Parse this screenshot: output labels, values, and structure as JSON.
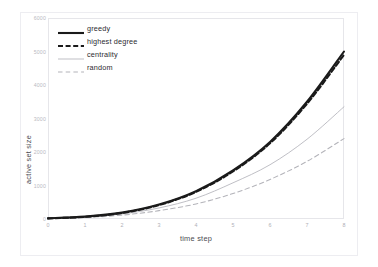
{
  "caption_fragment": "",
  "chart_data": {
    "type": "line",
    "title": "",
    "xlabel": "time step",
    "ylabel": "active set size",
    "xlim": [
      0,
      8
    ],
    "ylim": [
      0,
      6000
    ],
    "xticks": [
      "0",
      "1",
      "2",
      "3",
      "4",
      "5",
      "6",
      "7",
      "8"
    ],
    "yticks": [
      "0",
      "1000",
      "2000",
      "3000",
      "4000",
      "5000",
      "6000"
    ],
    "grid": false,
    "legend_position": "upper-left-inside",
    "x": [
      0,
      1,
      2,
      3,
      4,
      5,
      6,
      7,
      8
    ],
    "series": [
      {
        "name": "greedy",
        "style": "solid",
        "width": 2.1,
        "color": "#1a1a1a",
        "values": [
          20,
          70,
          190,
          430,
          830,
          1450,
          2300,
          3500,
          5000
        ]
      },
      {
        "name": "highest degree",
        "style": "dashed",
        "width": 2.1,
        "color": "#1a1a1a",
        "values": [
          18,
          65,
          180,
          415,
          810,
          1420,
          2260,
          3440,
          4900
        ]
      },
      {
        "name": "centrality",
        "style": "solid",
        "width": 0.85,
        "color": "#b4b4ba",
        "values": [
          15,
          55,
          150,
          330,
          620,
          1080,
          1620,
          2380,
          3350
        ]
      },
      {
        "name": "random",
        "style": "dashed",
        "width": 1.05,
        "color": "#b4b4ba",
        "values": [
          12,
          45,
          115,
          250,
          450,
          760,
          1180,
          1720,
          2400
        ]
      }
    ]
  },
  "legend": {
    "items": [
      {
        "label": "greedy"
      },
      {
        "label": "highest degree"
      },
      {
        "label": "centrality"
      },
      {
        "label": "random"
      }
    ]
  },
  "colors": {
    "series_dark": "#1a1a1a",
    "series_light": "#b4b4ba",
    "frame": "#e6e6ea",
    "tick_text": "#b5b5bb",
    "axis_title": "#4a4a50",
    "background": "#ffffff"
  }
}
